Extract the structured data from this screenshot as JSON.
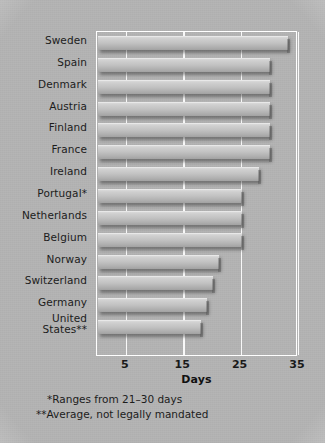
{
  "chart_data": {
    "type": "bar",
    "orientation": "horizontal",
    "title": "",
    "xlabel": "Days",
    "ylabel": "",
    "xlim": [
      0,
      35
    ],
    "xticks": [
      5,
      15,
      25,
      35
    ],
    "xtick_labels": [
      "5",
      "15",
      "25",
      "35"
    ],
    "grid": true,
    "grid_axis": "x",
    "legend": false,
    "categories": [
      "Sweden",
      "Spain",
      "Denmark",
      "Austria",
      "Finland",
      "France",
      "Ireland",
      "Portugal*",
      "Netherlands",
      "Belgium",
      "Norway",
      "Switzerland",
      "Germany",
      "United States**"
    ],
    "values": [
      33,
      30,
      30,
      30,
      30,
      30,
      28,
      25,
      25,
      25,
      21,
      20,
      19,
      18
    ],
    "annotations": [
      "*Ranges from 21-30 days",
      "**Average, not legally mandated"
    ]
  },
  "axis": {
    "title": "Days",
    "ticks": [
      {
        "value": 5,
        "label": "5"
      },
      {
        "value": 15,
        "label": "15"
      },
      {
        "value": 25,
        "label": "25"
      },
      {
        "value": 35,
        "label": "35"
      }
    ]
  },
  "categories": [
    {
      "label": "Sweden",
      "line1": "Sweden",
      "line2": "",
      "value": 33
    },
    {
      "label": "Spain",
      "line1": "Spain",
      "line2": "",
      "value": 30
    },
    {
      "label": "Denmark",
      "line1": "Denmark",
      "line2": "",
      "value": 30
    },
    {
      "label": "Austria",
      "line1": "Austria",
      "line2": "",
      "value": 30
    },
    {
      "label": "Finland",
      "line1": "Finland",
      "line2": "",
      "value": 30
    },
    {
      "label": "France",
      "line1": "France",
      "line2": "",
      "value": 30
    },
    {
      "label": "Ireland",
      "line1": "Ireland",
      "line2": "",
      "value": 28
    },
    {
      "label": "Portugal*",
      "line1": "Portugal*",
      "line2": "",
      "value": 25
    },
    {
      "label": "Netherlands",
      "line1": "Netherlands",
      "line2": "",
      "value": 25
    },
    {
      "label": "Belgium",
      "line1": "Belgium",
      "line2": "",
      "value": 25
    },
    {
      "label": "Norway",
      "line1": "Norway",
      "line2": "",
      "value": 21
    },
    {
      "label": "Switzerland",
      "line1": "Switzerland",
      "line2": "",
      "value": 20
    },
    {
      "label": "Germany",
      "line1": "Germany",
      "line2": "",
      "value": 19
    },
    {
      "label": "United States**",
      "line1": "United",
      "line2": "States**",
      "value": 18
    }
  ],
  "footnotes": {
    "first": "*Ranges from 21–30 days",
    "second": "**Average, not legally mandated"
  },
  "colors": {
    "background": "#b4b4b4",
    "bar_light": "#d9d9d9",
    "bar_dark": "#a2a2a2",
    "frame": "#ffffff",
    "text": "#1c1c1c"
  }
}
